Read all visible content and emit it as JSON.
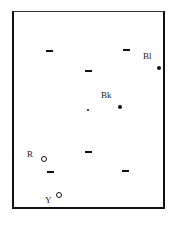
{
  "diagram": {
    "frame": {
      "x": 12,
      "y": 11,
      "w": 153,
      "h": 198
    },
    "dashes": [
      {
        "x": 46,
        "y": 50
      },
      {
        "x": 123,
        "y": 49
      },
      {
        "x": 85,
        "y": 70
      },
      {
        "x": 85,
        "y": 151
      },
      {
        "x": 47,
        "y": 171
      },
      {
        "x": 122,
        "y": 170
      }
    ],
    "points": [
      {
        "label": "Bl",
        "type": "filled",
        "x": 159,
        "y": 68,
        "label_x": 143,
        "label_y": 52
      },
      {
        "label": "Bk",
        "type": "filled",
        "x": 120,
        "y": 107,
        "label_x": 101,
        "label_y": 91
      },
      {
        "label": "",
        "type": "small-filled",
        "x": 88,
        "y": 110
      },
      {
        "label": "R",
        "type": "ring",
        "x": 44,
        "y": 159,
        "label_x": 27,
        "label_y": 150
      },
      {
        "label": "Y",
        "type": "ring",
        "x": 59,
        "y": 195,
        "label_x": 45,
        "label_y": 196
      }
    ]
  }
}
